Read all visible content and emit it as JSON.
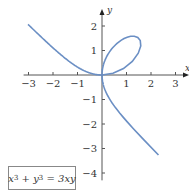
{
  "chart_data": {
    "type": "line",
    "title": "",
    "equation": "x^3 + y^3 = 3xy",
    "equation_parts": {
      "x": "x",
      "x_exp": "3",
      "plus": " + ",
      "y": "y",
      "y_exp": "3",
      "rhs": " = 3xy"
    },
    "xlabel": "x",
    "ylabel": "y",
    "xlim": [
      -3.2,
      3.5
    ],
    "ylim": [
      -4.3,
      2.7
    ],
    "x_ticks": [
      -3,
      -2,
      -1,
      1,
      2,
      3
    ],
    "y_ticks": [
      2,
      1,
      -1,
      -2,
      -3,
      -4
    ],
    "x_tick_labels": [
      "−3",
      "−2",
      "−1",
      "1",
      "2",
      "3"
    ],
    "y_tick_labels": [
      "2",
      "1",
      "−1",
      "−2",
      "−3",
      "−4"
    ],
    "grid": false,
    "legend": "none",
    "series": [
      {
        "name": "Folium of Descartes",
        "color": "#6b8fc4",
        "parametric": "x = 3t/(1+t^3), y = 3t^2/(1+t^3)",
        "sample_points": [
          [
            -3,
            2.0
          ],
          [
            -2,
            1.2
          ],
          [
            -1,
            0.45
          ],
          [
            0,
            0
          ],
          [
            0.75,
            1.3
          ],
          [
            1.5,
            1.5
          ],
          [
            1.2,
            0.5
          ],
          [
            0,
            0
          ],
          [
            0.5,
            -1.0
          ],
          [
            1.5,
            -2.6
          ],
          [
            3.0,
            -4.0
          ]
        ]
      }
    ]
  },
  "plot": {
    "origin_px": [
      102,
      75
    ],
    "unit_px": 24.5
  }
}
